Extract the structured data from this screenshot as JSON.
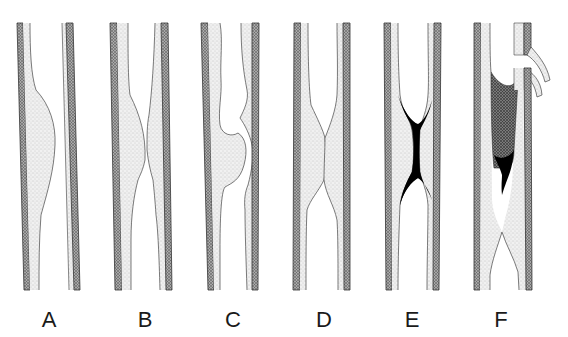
{
  "figure": {
    "colors": {
      "background": "#ffffff",
      "wall_outer": "#4a4a4a",
      "intima_stipple": "#d6d6d6",
      "thrombus_black": "#000000",
      "thrombus_hatched": "#555555",
      "outline": "#444444"
    },
    "panels": [
      {
        "id": "A",
        "label": "A",
        "x": 17
      },
      {
        "id": "B",
        "label": "B",
        "x": 110
      },
      {
        "id": "C",
        "label": "C",
        "x": 201
      },
      {
        "id": "D",
        "label": "D",
        "x": 294
      },
      {
        "id": "E",
        "label": "E",
        "x": 384
      },
      {
        "id": "F",
        "label": "F",
        "x": 474
      }
    ]
  }
}
